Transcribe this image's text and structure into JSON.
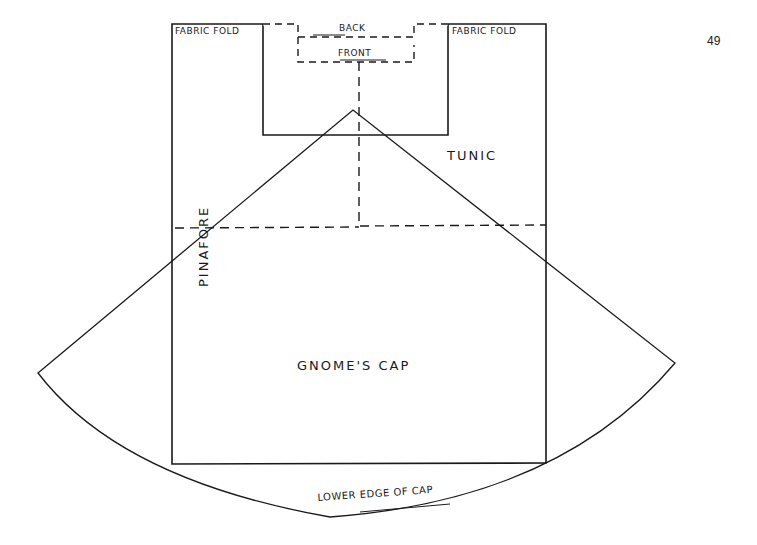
{
  "page": {
    "number": "49"
  },
  "labels": {
    "fabric_fold_left": "FABRIC FOLD",
    "fabric_fold_right": "FABRIC FOLD",
    "back": "BACK",
    "front": "FRONT",
    "tunic": "TUNIC",
    "pinafore": "PINAFORE",
    "gnomes_cap": "GNOME'S CAP",
    "lower_edge": "LOWER EDGE OF CAP"
  },
  "colors": {
    "line": "#1a1a1a",
    "background": "#ffffff"
  }
}
